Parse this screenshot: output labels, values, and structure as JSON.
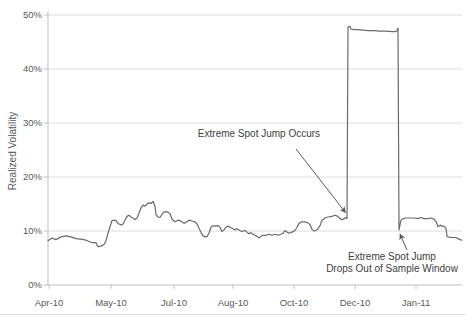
{
  "figure": {
    "y_axis_title": "Realized Volatility",
    "annotations": {
      "jump_occurs": {
        "text": "Extreme Spot Jump Occurs",
        "arrow": {
          "x1": 296,
          "y1": 149,
          "x2": 345.5,
          "y2": 212.5
        }
      },
      "jump_drops": {
        "line1": "Extreme Spot Jump",
        "line2": "Drops Out of Sample Window",
        "arrow": {
          "x1": 407,
          "y1": 250,
          "x2": 400,
          "y2": 234
        }
      }
    }
  },
  "chart_data": {
    "type": "line",
    "title": "",
    "xlabel": "",
    "ylabel": "Realized Volatility",
    "ylim": [
      0,
      50
    ],
    "grid": "horizontal",
    "legend": "none",
    "y_tick_values": [
      0,
      10,
      20,
      30,
      40,
      50
    ],
    "y_tick_labels": [
      "0%",
      "10%",
      "20%",
      "30%",
      "40%",
      "50%"
    ],
    "x_tick_labels": [
      "Apr-10",
      "May-10",
      "Jul-10",
      "Aug-10",
      "Oct-10",
      "Dec-10",
      "Jan-11"
    ],
    "x_tick_px": [
      49,
      111,
      174,
      233,
      294,
      355,
      416
    ],
    "series": [
      {
        "name": "Realized Volatility",
        "points_px_pct": [
          [
            48,
            8.2
          ],
          [
            52,
            8.7
          ],
          [
            56,
            8.4
          ],
          [
            61,
            8.9
          ],
          [
            66,
            9.1
          ],
          [
            71,
            8.9
          ],
          [
            76,
            8.6
          ],
          [
            81,
            8.5
          ],
          [
            86,
            8.3
          ],
          [
            91,
            7.9
          ],
          [
            96,
            7.8
          ],
          [
            98,
            7.1
          ],
          [
            101,
            7.2
          ],
          [
            104,
            7.5
          ],
          [
            106,
            8.2
          ],
          [
            108,
            9.6
          ],
          [
            110,
            10.8
          ],
          [
            112,
            11.9
          ],
          [
            114,
            12.0
          ],
          [
            116,
            11.9
          ],
          [
            118,
            11.4
          ],
          [
            121,
            11.1
          ],
          [
            123,
            11.3
          ],
          [
            125,
            12.0
          ],
          [
            127,
            12.7
          ],
          [
            129,
            12.9
          ],
          [
            131,
            12.6
          ],
          [
            133,
            12.4
          ],
          [
            135,
            12.1
          ],
          [
            137,
            12.4
          ],
          [
            139,
            13.3
          ],
          [
            141,
            14.3
          ],
          [
            143,
            14.8
          ],
          [
            145,
            14.6
          ],
          [
            147,
            15.0
          ],
          [
            149,
            15.2
          ],
          [
            151,
            15.1
          ],
          [
            153,
            15.5
          ],
          [
            155,
            14.6
          ],
          [
            156,
            13.0
          ],
          [
            158,
            12.6
          ],
          [
            160,
            12.5
          ],
          [
            162,
            13.1
          ],
          [
            164,
            13.5
          ],
          [
            166,
            13.6
          ],
          [
            168,
            13.5
          ],
          [
            170,
            13.2
          ],
          [
            172,
            12.2
          ],
          [
            175,
            11.7
          ],
          [
            178,
            12.0
          ],
          [
            180,
            11.9
          ],
          [
            182,
            11.7
          ],
          [
            184,
            11.4
          ],
          [
            187,
            11.7
          ],
          [
            189,
            12.0
          ],
          [
            191,
            11.9
          ],
          [
            193,
            11.8
          ],
          [
            195,
            11.7
          ],
          [
            197,
            11.3
          ],
          [
            199,
            10.5
          ],
          [
            201,
            9.7
          ],
          [
            203,
            9.1
          ],
          [
            205,
            8.9
          ],
          [
            207,
            9.0
          ],
          [
            209,
            9.6
          ],
          [
            211,
            10.7
          ],
          [
            213,
            11.0
          ],
          [
            215,
            10.9
          ],
          [
            218,
            11.0
          ],
          [
            220,
            10.7
          ],
          [
            222,
            9.9
          ],
          [
            224,
            10.2
          ],
          [
            226,
            10.7
          ],
          [
            228,
            10.9
          ],
          [
            230,
            10.7
          ],
          [
            233,
            10.4
          ],
          [
            235,
            10.2
          ],
          [
            237,
            10.4
          ],
          [
            240,
            10.1
          ],
          [
            242,
            9.9
          ],
          [
            245,
            10.1
          ],
          [
            247,
            9.8
          ],
          [
            249,
            9.5
          ],
          [
            251,
            9.7
          ],
          [
            253,
            9.4
          ],
          [
            255,
            9.2
          ],
          [
            257,
            9.0
          ],
          [
            259,
            8.7
          ],
          [
            261,
            9.0
          ],
          [
            263,
            9.2
          ],
          [
            266,
            9.2
          ],
          [
            269,
            9.4
          ],
          [
            272,
            9.2
          ],
          [
            275,
            9.4
          ],
          [
            278,
            9.2
          ],
          [
            281,
            9.4
          ],
          [
            283,
            9.6
          ],
          [
            285,
            10.1
          ],
          [
            287,
            9.8
          ],
          [
            289,
            9.6
          ],
          [
            292,
            9.8
          ],
          [
            295,
            10.1
          ],
          [
            297,
            10.7
          ],
          [
            299,
            11.4
          ],
          [
            302,
            11.7
          ],
          [
            305,
            11.7
          ],
          [
            308,
            11.5
          ],
          [
            310,
            11.2
          ],
          [
            312,
            10.3
          ],
          [
            314,
            10.0
          ],
          [
            316,
            10.1
          ],
          [
            318,
            10.4
          ],
          [
            320,
            11.0
          ],
          [
            322,
            12.0
          ],
          [
            325,
            12.4
          ],
          [
            328,
            12.6
          ],
          [
            332,
            12.7
          ],
          [
            335,
            12.9
          ],
          [
            338,
            12.7
          ],
          [
            340,
            12.3
          ],
          [
            342,
            12.1
          ],
          [
            344,
            12.3
          ],
          [
            346,
            12.5
          ],
          [
            347,
            12.3
          ],
          [
            348,
            47.8
          ],
          [
            350,
            47.9
          ],
          [
            351,
            47.4
          ],
          [
            354,
            47.3
          ],
          [
            358,
            47.3
          ],
          [
            363,
            47.2
          ],
          [
            368,
            47.1
          ],
          [
            374,
            47.1
          ],
          [
            380,
            47.0
          ],
          [
            386,
            47.0
          ],
          [
            392,
            46.9
          ],
          [
            395,
            46.9
          ],
          [
            397,
            47.1
          ],
          [
            398,
            47.6
          ],
          [
            399,
            10.2
          ],
          [
            401,
            12.0
          ],
          [
            403,
            12.3
          ],
          [
            406,
            12.4
          ],
          [
            410,
            12.4
          ],
          [
            414,
            12.4
          ],
          [
            418,
            12.3
          ],
          [
            421,
            12.5
          ],
          [
            424,
            12.3
          ],
          [
            428,
            12.3
          ],
          [
            431,
            12.4
          ],
          [
            434,
            12.2
          ],
          [
            436,
            11.8
          ],
          [
            438,
            10.8
          ],
          [
            440,
            11.1
          ],
          [
            442,
            10.9
          ],
          [
            444,
            10.9
          ],
          [
            446,
            10.5
          ],
          [
            447,
            9.0
          ],
          [
            450,
            8.8
          ],
          [
            453,
            8.8
          ],
          [
            456,
            8.8
          ],
          [
            458,
            8.6
          ],
          [
            460,
            8.4
          ],
          [
            462,
            8.3
          ]
        ]
      }
    ],
    "colors": {
      "line": "#6a6a6a",
      "grid": "#dcdcdc",
      "axis": "#bfbfbf",
      "tick_text": "#595959",
      "annotation_text": "#404040",
      "arrow": "#595959",
      "rule": "#d8d8d8"
    }
  }
}
